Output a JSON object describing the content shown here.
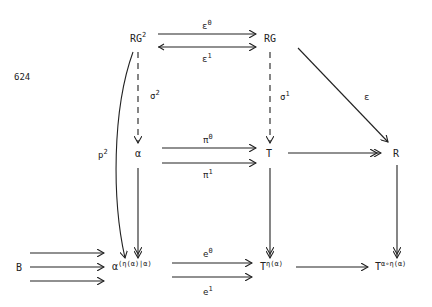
{
  "page_number": "624",
  "nodes": {
    "RG2": {
      "base": "RG",
      "sup": "2"
    },
    "RG": {
      "base": "RG"
    },
    "alpha": {
      "base": "α"
    },
    "T": {
      "base": "T"
    },
    "R": {
      "base": "R"
    },
    "B": {
      "base": "B"
    },
    "alpha_eta": {
      "base": "α",
      "sup": "(η(α)|α)"
    },
    "T_eta": {
      "base": "T",
      "sup": "η(α)"
    },
    "T_alpha_eta": {
      "base": "T",
      "sup": "α∘η(α)"
    }
  },
  "labels": {
    "eps0": {
      "base": "ε",
      "sup": "0"
    },
    "eps1": {
      "base": "ε",
      "sup": "1"
    },
    "sigma2": {
      "base": "σ",
      "sup": "2"
    },
    "sigma1": {
      "base": "σ",
      "sup": "1"
    },
    "eps": {
      "base": "ε"
    },
    "p2": {
      "base": "p",
      "sup": "2"
    },
    "pi0": {
      "base": "π",
      "sup": "0"
    },
    "pi1": {
      "base": "π",
      "sup": "1"
    },
    "e0": {
      "base": "e",
      "sup": "0"
    },
    "e1": {
      "base": "e",
      "sup": "1"
    }
  }
}
